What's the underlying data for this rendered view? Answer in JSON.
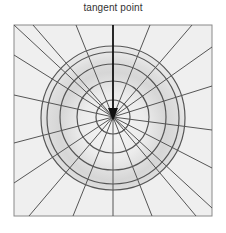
{
  "figure": {
    "label": "tangent point",
    "colors": {
      "background": "#efefef",
      "frame": "#8a8a8a",
      "lines": "#555555",
      "arrow": "#111111",
      "band_shade": "#d4d4d4"
    },
    "frame": {
      "x": 14,
      "y": 25,
      "width": 198,
      "height": 191
    },
    "center": {
      "x": 113,
      "y": 117
    },
    "circle_radii": [
      72,
      66,
      53,
      36,
      17
    ],
    "radial_endpoints": [
      [
        33,
        25
      ],
      [
        76,
        25
      ],
      [
        150,
        25
      ],
      [
        192,
        25
      ],
      [
        212,
        47
      ],
      [
        212,
        86
      ],
      [
        212,
        130
      ],
      [
        212,
        168
      ],
      [
        212,
        208
      ],
      [
        196,
        216
      ],
      [
        152,
        216
      ],
      [
        113,
        216
      ],
      [
        73,
        216
      ],
      [
        29,
        216
      ],
      [
        14,
        183
      ],
      [
        14,
        143
      ],
      [
        14,
        95
      ],
      [
        14,
        55
      ],
      [
        14,
        25
      ]
    ],
    "arrow": {
      "from_y": 25,
      "tip_y": 121,
      "head_top_y": 108,
      "head_half_width": 5
    }
  }
}
